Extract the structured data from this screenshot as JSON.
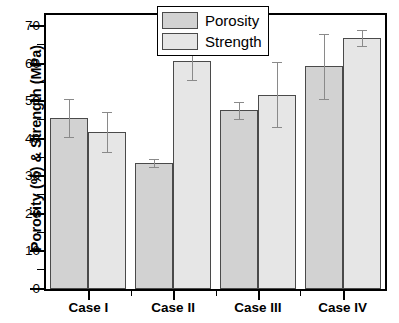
{
  "chart_data": {
    "type": "bar",
    "title": "",
    "xlabel": "",
    "ylabel": "Porosity (%) & Strength (MPa)",
    "categories": [
      "Case I",
      "Case II",
      "Case III",
      "Case IV"
    ],
    "series": [
      {
        "name": "Porosity",
        "color": "#d2d2d2",
        "values": [
          45.6,
          33.5,
          47.6,
          59.3
        ],
        "errors": [
          5.0,
          1.1,
          2.3,
          8.6
        ]
      },
      {
        "name": "Strength",
        "color": "#e6e6e6",
        "values": [
          41.8,
          60.7,
          51.8,
          66.8
        ],
        "errors": [
          5.4,
          5.1,
          8.6,
          2.1
        ]
      }
    ],
    "ylim": [
      0,
      73
    ],
    "y_ticks": [
      0,
      10,
      20,
      30,
      40,
      50,
      60,
      70
    ],
    "y_tick_labels": [
      "0",
      "10",
      "20",
      "30",
      "40",
      "50",
      "60",
      "70"
    ],
    "y_minor_ticks": [
      5,
      15,
      25,
      35,
      45,
      55,
      65
    ],
    "grid": false,
    "legend_position": "top-right",
    "legend_entries": [
      "Porosity",
      "Strength"
    ],
    "axis_color": "#000000",
    "bar_edge_color": "#4a4a4a",
    "error_bar_color": "#8a8a8a"
  }
}
